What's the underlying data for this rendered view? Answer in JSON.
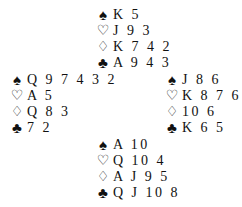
{
  "suits": {
    "spades": "♠",
    "hearts": "♡",
    "diamonds": "♢",
    "clubs": "♣"
  },
  "hands": {
    "north": {
      "spades": "K 5",
      "hearts": "J 9 3",
      "diamonds": "K 7 4 2",
      "clubs": "A 9 4 3"
    },
    "west": {
      "spades": "Q 9 7 4 3 2",
      "hearts": "A 5",
      "diamonds": "Q 8 3",
      "clubs": "7 2"
    },
    "east": {
      "spades": "J 8 6",
      "hearts": "K 8 7 6 2",
      "diamonds": "10 6",
      "clubs": "K 6 5"
    },
    "south": {
      "spades": "A 10",
      "hearts": "Q 10 4",
      "diamonds": "A J 9 5",
      "clubs": "Q J 10 8"
    }
  }
}
